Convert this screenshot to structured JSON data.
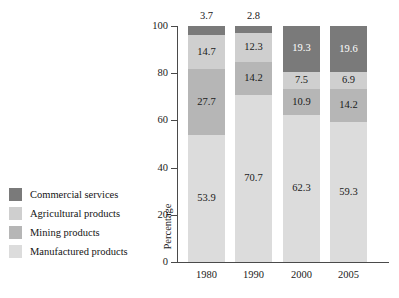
{
  "chart_data": {
    "type": "bar",
    "subtype": "stacked-bar-100",
    "title": "",
    "xlabel": "",
    "ylabel": "Percentage",
    "ylim": [
      0,
      100
    ],
    "yticks": [
      0,
      20,
      40,
      60,
      80,
      100
    ],
    "ytick_labels": [
      "0",
      "20",
      "40",
      "60",
      "80",
      "100"
    ],
    "grid": false,
    "legend_position": "left",
    "categories": [
      "1980",
      "1990",
      "2000",
      "2005"
    ],
    "series": [
      {
        "name": "Manufactured products",
        "color": "#dcdcdc",
        "values": [
          53.9,
          70.7,
          62.3,
          59.3
        ],
        "labels": [
          "53.9",
          "70.7",
          "62.3",
          "59.3"
        ]
      },
      {
        "name": "Mining products",
        "color": "#b6b6b6",
        "values": [
          27.7,
          14.2,
          10.9,
          14.2
        ],
        "labels": [
          "27.7",
          "14.2",
          "10.9",
          "14.2"
        ]
      },
      {
        "name": "Agricultural products",
        "color": "#cfcfcf",
        "values": [
          14.7,
          12.3,
          7.5,
          6.9
        ],
        "labels": [
          "14.7",
          "12.3",
          "7.5",
          "6.9"
        ]
      },
      {
        "name": "Commercial services",
        "color": "#7a7a7a",
        "values": [
          3.7,
          2.8,
          19.3,
          19.6
        ],
        "labels": [
          "3.7",
          "2.8",
          "19.3",
          "19.6"
        ]
      }
    ]
  },
  "legend": {
    "items": [
      {
        "label": "Commercial services",
        "color": "#7a7a7a"
      },
      {
        "label": "Agricultural products",
        "color": "#cfcfcf"
      },
      {
        "label": "Mining products",
        "color": "#b6b6b6"
      },
      {
        "label": "Manufactured products",
        "color": "#dcdcdc"
      }
    ]
  },
  "axes": {
    "y_title": "Percentage",
    "y_tick_labels": [
      "100",
      "80",
      "60",
      "40",
      "20",
      "0"
    ],
    "x_tick_labels": [
      "1980",
      "1990",
      "2000",
      "2005"
    ]
  },
  "colors": {
    "axis": "#4a4a4a",
    "text": "#1a1a1a",
    "background": "#ffffff"
  }
}
